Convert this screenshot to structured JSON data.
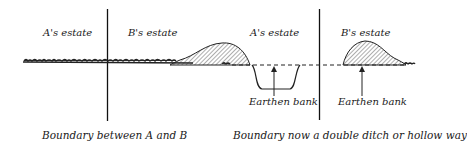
{
  "left_diagram": {
    "label_a": "A's estate",
    "label_b": "B's estate",
    "caption": "Boundary between A and B"
  },
  "right_diagram": {
    "label_a": "A's estate",
    "label_b": "B's estate",
    "bank_left": "Earthen bank",
    "bank_right": "Earthen bank",
    "caption": "Boundary now a double ditch or hollow way"
  },
  "colors": {
    "ink": "#1a1a1a",
    "background": "#ffffff"
  }
}
